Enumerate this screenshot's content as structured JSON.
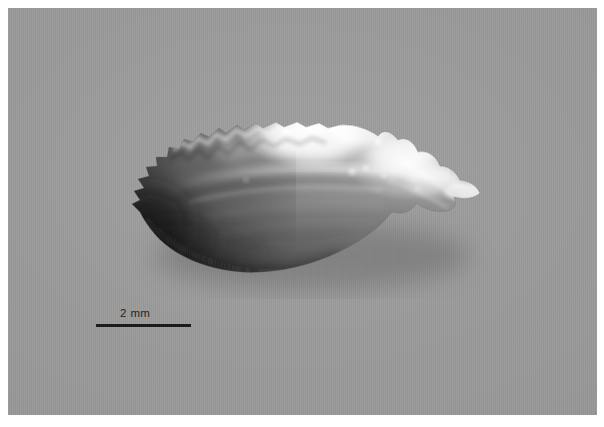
{
  "page": {
    "background_color": "#ffffff",
    "width": 604,
    "height": 427
  },
  "plate": {
    "name": "specimen-photograph",
    "background_color": "#9a9a9a",
    "description": "Grayscale photomicrograph of a fish otolith (sagitta) in medial view, oriented with the crenulated dorsal and anterior margins to the upper left and a smooth ventral margin to the lower right."
  },
  "specimen": {
    "name": "otolith",
    "alt": "Fish otolith specimen, translucent white calcium carbonate with scalloped crenulate margin and a horizontal sulcus acusticus groove",
    "highlight_color": "#f2f2f2",
    "body_color": "#b8b8b8",
    "shadow_color": "#3a3a3a"
  },
  "scale_bar": {
    "name": "scale-bar",
    "label": "2 mm",
    "value": 2,
    "unit": "mm",
    "line_color": "#1c1c1c",
    "line_length_px": 95
  }
}
